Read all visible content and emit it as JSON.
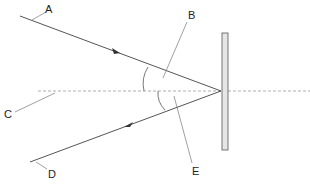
{
  "diagram": {
    "type": "reflection-plane-mirror",
    "labels": {
      "A": "A",
      "B": "B",
      "C": "C",
      "D": "D",
      "E": "E"
    },
    "colors": {
      "ray": "#555555",
      "normal": "#9a9a9a",
      "mirror_fill": "#e6e6e6",
      "mirror_stroke": "#555555",
      "text": "#222222"
    }
  }
}
